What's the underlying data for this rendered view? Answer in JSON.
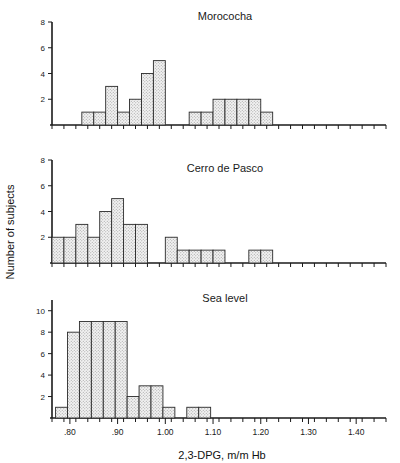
{
  "figure": {
    "y_axis_label": "Number of subjects",
    "x_axis_label": "2,3-DPG, m/m Hb",
    "background_color": "#ffffff",
    "line_color": "#1a1a1a",
    "bar_fill_color": "#e8e8e8",
    "bar_stroke_color": "#2b2b2b"
  },
  "chart_data": [
    {
      "type": "bar",
      "title": "Morococha",
      "xlabel": "2,3-DPG, m/m Hb",
      "ylabel": "Number of subjects",
      "xlim": [
        0.7625,
        1.4625
      ],
      "ylim": [
        0,
        8
      ],
      "bin_width": 0.025,
      "yticks": [
        2,
        4,
        6,
        8
      ],
      "ytick_labels": [
        "2",
        "4",
        "6",
        "8"
      ],
      "xticks": [
        0.8,
        0.9,
        1.0,
        1.1,
        1.2,
        1.3,
        1.4
      ],
      "xtick_labels": [
        ".80",
        ".90",
        "1.00",
        "1.10",
        "1.20",
        "1.30",
        "1.40"
      ],
      "grid": false,
      "legend": "none",
      "bins": [
        {
          "x0": 0.825,
          "x1": 0.85,
          "count": 1
        },
        {
          "x0": 0.85,
          "x1": 0.875,
          "count": 1
        },
        {
          "x0": 0.875,
          "x1": 0.9,
          "count": 3
        },
        {
          "x0": 0.9,
          "x1": 0.925,
          "count": 1
        },
        {
          "x0": 0.925,
          "x1": 0.95,
          "count": 2
        },
        {
          "x0": 0.95,
          "x1": 0.975,
          "count": 4
        },
        {
          "x0": 0.975,
          "x1": 1.0,
          "count": 5
        },
        {
          "x0": 1.05,
          "x1": 1.075,
          "count": 1
        },
        {
          "x0": 1.075,
          "x1": 1.1,
          "count": 1
        },
        {
          "x0": 1.1,
          "x1": 1.125,
          "count": 2
        },
        {
          "x0": 1.125,
          "x1": 1.15,
          "count": 2
        },
        {
          "x0": 1.15,
          "x1": 1.175,
          "count": 2
        },
        {
          "x0": 1.175,
          "x1": 1.2,
          "count": 2
        },
        {
          "x0": 1.2,
          "x1": 1.225,
          "count": 1
        }
      ],
      "values": [
        1,
        1,
        3,
        1,
        2,
        4,
        5,
        1,
        1,
        2,
        2,
        2,
        2,
        1
      ]
    },
    {
      "type": "bar",
      "title": "Cerro de Pasco",
      "xlabel": "2,3-DPG, m/m Hb",
      "ylabel": "Number of subjects",
      "xlim": [
        0.7625,
        1.4625
      ],
      "ylim": [
        0,
        8
      ],
      "bin_width": 0.025,
      "yticks": [
        2,
        4,
        6,
        8
      ],
      "ytick_labels": [
        "2",
        "4",
        "6",
        "8"
      ],
      "xticks": [
        0.8,
        0.9,
        1.0,
        1.1,
        1.2,
        1.3,
        1.4
      ],
      "xtick_labels": [
        ".80",
        ".90",
        "1.00",
        "1.10",
        "1.20",
        "1.30",
        "1.40"
      ],
      "grid": false,
      "legend": "none",
      "bins": [
        {
          "x0": 0.7625,
          "x1": 0.7875,
          "count": 2
        },
        {
          "x0": 0.7875,
          "x1": 0.8125,
          "count": 2
        },
        {
          "x0": 0.8125,
          "x1": 0.8375,
          "count": 3
        },
        {
          "x0": 0.8375,
          "x1": 0.8625,
          "count": 2
        },
        {
          "x0": 0.8625,
          "x1": 0.8875,
          "count": 4
        },
        {
          "x0": 0.8875,
          "x1": 0.9125,
          "count": 5
        },
        {
          "x0": 0.9125,
          "x1": 0.9375,
          "count": 3
        },
        {
          "x0": 0.9375,
          "x1": 0.9625,
          "count": 3
        },
        {
          "x0": 1.0,
          "x1": 1.025,
          "count": 2
        },
        {
          "x0": 1.025,
          "x1": 1.05,
          "count": 1
        },
        {
          "x0": 1.05,
          "x1": 1.075,
          "count": 1
        },
        {
          "x0": 1.075,
          "x1": 1.1,
          "count": 1
        },
        {
          "x0": 1.1,
          "x1": 1.125,
          "count": 1
        },
        {
          "x0": 1.175,
          "x1": 1.2,
          "count": 1
        },
        {
          "x0": 1.2,
          "x1": 1.225,
          "count": 1
        }
      ],
      "values": [
        2,
        2,
        3,
        2,
        4,
        5,
        3,
        3,
        2,
        1,
        1,
        1,
        1,
        1,
        1
      ]
    },
    {
      "type": "bar",
      "title": "Sea level",
      "xlabel": "2,3-DPG, m/m Hb",
      "ylabel": "Number of subjects",
      "xlim": [
        0.7625,
        1.4625
      ],
      "ylim": [
        0,
        11
      ],
      "bin_width": 0.025,
      "yticks": [
        2,
        4,
        6,
        8,
        10
      ],
      "ytick_labels": [
        "2",
        "4",
        "6",
        "8",
        "10"
      ],
      "xticks": [
        0.8,
        0.9,
        1.0,
        1.1,
        1.2,
        1.3,
        1.4
      ],
      "xtick_labels": [
        ".80",
        ".90",
        "1.00",
        "1.10",
        "1.20",
        "1.30",
        "1.40"
      ],
      "grid": false,
      "legend": "none",
      "bins": [
        {
          "x0": 0.77,
          "x1": 0.795,
          "count": 1
        },
        {
          "x0": 0.795,
          "x1": 0.82,
          "count": 8
        },
        {
          "x0": 0.82,
          "x1": 0.845,
          "count": 9
        },
        {
          "x0": 0.845,
          "x1": 0.87,
          "count": 9
        },
        {
          "x0": 0.87,
          "x1": 0.895,
          "count": 9
        },
        {
          "x0": 0.895,
          "x1": 0.92,
          "count": 9
        },
        {
          "x0": 0.92,
          "x1": 0.945,
          "count": 2
        },
        {
          "x0": 0.945,
          "x1": 0.97,
          "count": 3
        },
        {
          "x0": 0.97,
          "x1": 0.995,
          "count": 3
        },
        {
          "x0": 0.995,
          "x1": 1.02,
          "count": 1
        },
        {
          "x0": 1.045,
          "x1": 1.07,
          "count": 1
        },
        {
          "x0": 1.07,
          "x1": 1.095,
          "count": 1
        }
      ],
      "values": [
        1,
        8,
        9,
        9,
        9,
        9,
        2,
        3,
        3,
        1,
        1,
        1
      ]
    }
  ]
}
